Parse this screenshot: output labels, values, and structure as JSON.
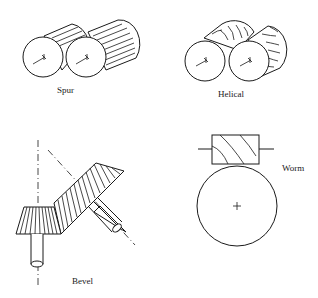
{
  "diagram": {
    "gears": [
      {
        "id": "spur",
        "label": "Spur"
      },
      {
        "id": "helical",
        "label": "Helical"
      },
      {
        "id": "bevel",
        "label": "Bevel"
      },
      {
        "id": "worm",
        "label": "Worm"
      }
    ],
    "colors": {
      "line": "#1a1a1a",
      "background": "#ffffff"
    }
  }
}
